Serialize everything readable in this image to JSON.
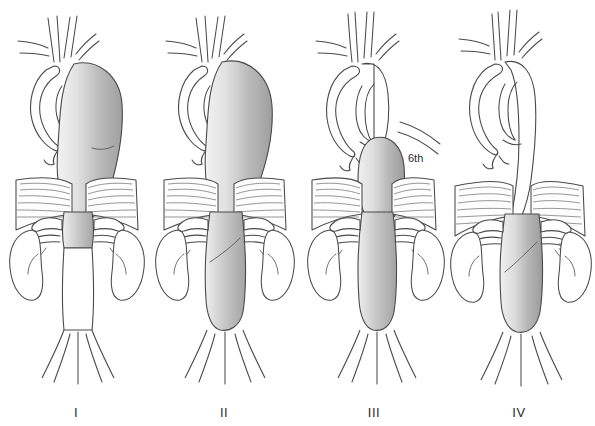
{
  "figure": {
    "background_color": "#ffffff",
    "line_color": "#4a4a4a",
    "shading_light": "#ececec",
    "shading_mid": "#c9c9c9",
    "shading_dark": "#a2a2a2",
    "panel_count": 4
  },
  "annotations": [
    {
      "id": "rib-level",
      "text": "6th",
      "panel": "III",
      "meaning": "sixth-intercostal-space-level"
    }
  ],
  "panels": [
    {
      "label": "I",
      "type": "crawford-type-1",
      "aneurysm_present": true,
      "extent_start": "left subclavian artery",
      "extent_end": "above the renal arteries",
      "thoracic_involved": true,
      "abdominal_involved": false,
      "shaded_segments": [
        "descending-thoracic-aorta",
        "upper-visceral-segment"
      ],
      "normal_segments": [
        "aortic-arch",
        "infrarenal-abdominal-aorta",
        "iliac-arteries"
      ]
    },
    {
      "label": "II",
      "type": "crawford-type-2",
      "aneurysm_present": true,
      "extent_start": "left subclavian artery",
      "extent_end": "aortic bifurcation",
      "thoracic_involved": true,
      "abdominal_involved": true,
      "shaded_segments": [
        "descending-thoracic-aorta",
        "visceral-segment",
        "infrarenal-abdominal-aorta"
      ],
      "normal_segments": [
        "aortic-arch",
        "iliac-arteries"
      ]
    },
    {
      "label": "III",
      "type": "crawford-type-3",
      "aneurysm_present": true,
      "extent_start": "sixth intercostal space",
      "extent_end": "aortic bifurcation",
      "thoracic_involved": true,
      "abdominal_involved": true,
      "shaded_segments": [
        "distal-descending-thoracic-aorta",
        "visceral-segment",
        "infrarenal-abdominal-aorta"
      ],
      "normal_segments": [
        "aortic-arch",
        "proximal-descending-thoracic-aorta",
        "iliac-arteries"
      ]
    },
    {
      "label": "IV",
      "type": "crawford-type-4",
      "aneurysm_present": true,
      "extent_start": "diaphragm",
      "extent_end": "aortic bifurcation",
      "thoracic_involved": false,
      "abdominal_involved": true,
      "shaded_segments": [
        "visceral-segment",
        "infrarenal-abdominal-aorta"
      ],
      "normal_segments": [
        "aortic-arch",
        "descending-thoracic-aorta",
        "iliac-arteries"
      ]
    }
  ],
  "anatomy": {
    "arch_branches": [
      "brachiocephalic-artery",
      "left-common-carotid-artery",
      "left-subclavian-artery"
    ],
    "visceral_branches": [
      "celiac-artery",
      "superior-mesenteric-artery",
      "right-renal-artery",
      "left-renal-artery"
    ],
    "organs": [
      "right-kidney",
      "left-kidney",
      "diaphragm"
    ],
    "terminal": [
      "right-common-iliac-artery",
      "left-common-iliac-artery"
    ]
  }
}
